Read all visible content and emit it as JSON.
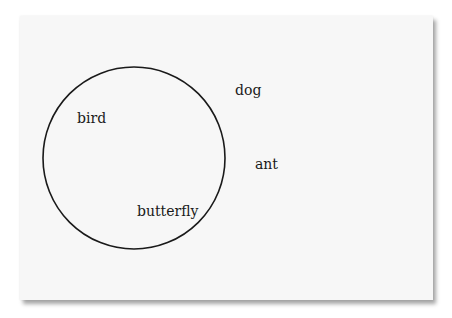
{
  "diagram": {
    "type": "venn",
    "circle": {
      "cx": 134,
      "cy": 158,
      "r": 91,
      "stroke": "#1a1a1a"
    },
    "labels": [
      {
        "id": "bird",
        "text": "bird",
        "inside": true,
        "x": 77,
        "y": 111
      },
      {
        "id": "butterfly",
        "text": "butterfly",
        "inside": true,
        "x": 137,
        "y": 204
      },
      {
        "id": "dog",
        "text": "dog",
        "inside": false,
        "x": 235,
        "y": 83
      },
      {
        "id": "ant",
        "text": "ant",
        "inside": false,
        "x": 255,
        "y": 157
      }
    ]
  },
  "colors": {
    "card_background": "#f7f7f7",
    "page_background": "#ffffff",
    "ink": "#1a1a1a"
  }
}
